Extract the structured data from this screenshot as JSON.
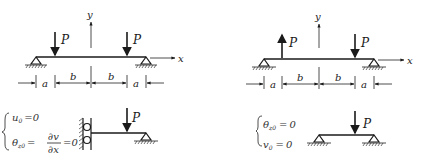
{
  "figure_left": {
    "axis_y_label": "y",
    "axis_x_label": "x",
    "loads": [
      {
        "label": "P",
        "direction": "down"
      },
      {
        "label": "P",
        "direction": "down"
      }
    ],
    "dimensions": [
      "a",
      "b",
      "b",
      "a"
    ],
    "half_model": {
      "load_label": "P",
      "conditions": [
        {
          "lhs": "u",
          "sub": "0",
          "rhs": "0"
        },
        {
          "lhs": "θ",
          "sub": "z0",
          "mid_num": "∂v",
          "mid_den": "∂x",
          "rhs": "0"
        }
      ]
    }
  },
  "figure_right": {
    "axis_y_label": "y",
    "axis_x_label": "x",
    "loads": [
      {
        "label": "P",
        "direction": "up"
      },
      {
        "label": "P",
        "direction": "down"
      }
    ],
    "dimensions": [
      "a",
      "b",
      "b",
      "a"
    ],
    "half_model": {
      "load_label": "P",
      "conditions": [
        {
          "lhs": "θ",
          "sub": "z0",
          "rhs": "0"
        },
        {
          "lhs": "v",
          "sub": "0",
          "rhs": "0"
        }
      ]
    }
  },
  "symbols": {
    "equals": "=",
    "zero": "0"
  }
}
